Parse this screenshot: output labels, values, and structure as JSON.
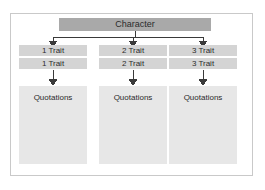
{
  "diagram": {
    "type": "tree-hierarchy",
    "orientation": "top-down",
    "colors": {
      "root_fill": "#a9a9a9",
      "trait_fill": "#d4d4d4",
      "quotation_fill": "#e7e7e7",
      "frame_border": "#c9c9c9",
      "connector": "#3a3a3a",
      "text": "#2b2b2b",
      "page_background": "#ffffff"
    },
    "root": {
      "label": "Character"
    },
    "columns": [
      {
        "id": "column-1",
        "trait_primary": "1 Trait",
        "trait_secondary": "1 Trait",
        "quotation": "Quotations"
      },
      {
        "id": "column-2",
        "trait_primary": "2 Trait",
        "trait_secondary": "2 Trait",
        "quotation": "Quotations"
      },
      {
        "id": "column-3",
        "trait_primary": "3 Trait",
        "trait_secondary": "3 Trait",
        "quotation": "Quotations"
      }
    ],
    "connectors": [
      {
        "from": "root",
        "to": "column-1-trait",
        "style": "elbow-arrow"
      },
      {
        "from": "root",
        "to": "column-2-trait",
        "style": "elbow-arrow"
      },
      {
        "from": "root",
        "to": "column-3-trait",
        "style": "elbow-arrow"
      },
      {
        "from": "column-1-trait",
        "to": "column-1-quotation",
        "style": "straight-arrow"
      },
      {
        "from": "column-2-trait",
        "to": "column-2-quotation",
        "style": "straight-arrow"
      },
      {
        "from": "column-3-trait",
        "to": "column-3-quotation",
        "style": "straight-arrow"
      }
    ]
  }
}
